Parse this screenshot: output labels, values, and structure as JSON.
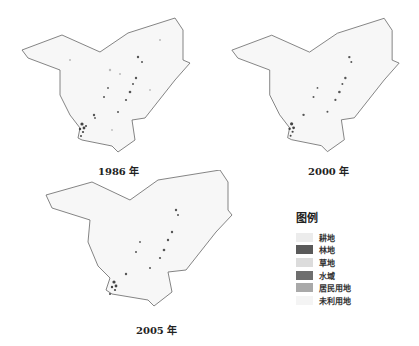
{
  "maps": [
    {
      "year_label": "1986 年"
    },
    {
      "year_label": "2000 年"
    },
    {
      "year_label": "2005 年"
    }
  ],
  "legend": {
    "title": "图例",
    "items": [
      {
        "label": "耕地",
        "color": "#ececec"
      },
      {
        "label": "林地",
        "color": "#5a5a5a"
      },
      {
        "label": "草地",
        "color": "#dcdcdc"
      },
      {
        "label": "水域",
        "color": "#6e6e6e"
      },
      {
        "label": "居民用地",
        "color": "#a9a9a9"
      },
      {
        "label": "未利用地",
        "color": "#f4f4f4"
      }
    ]
  }
}
